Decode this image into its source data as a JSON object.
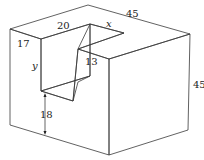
{
  "figure": {
    "colors": {
      "top_face": "#ffffff",
      "left_face": "#ededed",
      "right_face": "#e4e4e4",
      "notch_back": "#d9d9d9",
      "notch_inner": "#f4f4f4",
      "edge": "#3a3a3a"
    },
    "labels": {
      "top_width": "45",
      "notch_width": "20",
      "notch_depth": "x",
      "left_margin": "17",
      "notch_height": "y",
      "step": "13",
      "bottom_height": "18",
      "right_height": "45"
    }
  }
}
